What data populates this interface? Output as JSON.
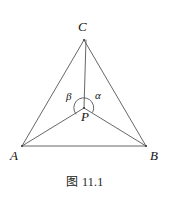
{
  "figure": {
    "caption": "图 11.1",
    "background_color": "#ffffff",
    "stroke_color": "#555555",
    "text_color": "#111111",
    "canvas": {
      "width": 170,
      "height": 199
    }
  },
  "labels": {
    "vertex_c": "C",
    "vertex_a": "A",
    "vertex_b": "B",
    "point_p": "P",
    "angle_alpha": "α",
    "angle_beta": "β"
  },
  "geometry": {
    "points": {
      "A": {
        "x": 22,
        "y": 146
      },
      "B": {
        "x": 146,
        "y": 146
      },
      "C": {
        "x": 84,
        "y": 40
      },
      "P": {
        "x": 84,
        "y": 108
      }
    },
    "segments": [
      {
        "name": "side-AB",
        "from": "A",
        "to": "B"
      },
      {
        "name": "side-BC",
        "from": "B",
        "to": "C"
      },
      {
        "name": "side-CA",
        "from": "C",
        "to": "A"
      },
      {
        "name": "cevian-PA",
        "from": "P",
        "to": "A"
      },
      {
        "name": "cevian-PB",
        "from": "P",
        "to": "B"
      },
      {
        "name": "cevian-PC",
        "from": "P",
        "to": "C"
      }
    ],
    "angle_arc": {
      "name": "reflex-angle-arc-at-P",
      "center": "P",
      "radius": 10
    }
  }
}
